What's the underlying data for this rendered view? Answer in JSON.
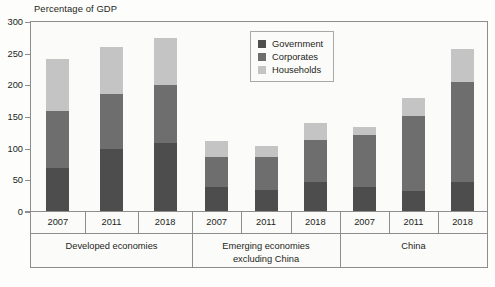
{
  "chart": {
    "title": "Percentage of GDP",
    "axis": {
      "y_ticks": [
        "0",
        "50",
        "100",
        "150",
        "200",
        "250",
        "300"
      ],
      "ylim_min": 0,
      "ylim_max": 300
    },
    "legend": {
      "items": [
        {
          "label": "Government",
          "color": "#4d4d4d"
        },
        {
          "label": "Corporates",
          "color": "#6e6e6e"
        },
        {
          "label": "Households",
          "color": "#c4c4c4"
        }
      ]
    },
    "groups": [
      {
        "name": "Developed economies",
        "line1": "Developed economies",
        "line2": ""
      },
      {
        "name": "Emerging economies excluding China",
        "line1": "Emerging economies",
        "line2": "excluding China"
      },
      {
        "name": "China",
        "line1": "China",
        "line2": ""
      }
    ],
    "years": [
      "2007",
      "2011",
      "2018",
      "2007",
      "2011",
      "2018",
      "2007",
      "2011",
      "2018"
    ]
  },
  "chart_data": {
    "type": "bar",
    "stacked": true,
    "title": "Percentage of GDP",
    "xlabel": "",
    "ylabel": "Percentage of GDP",
    "ylim": [
      0,
      300
    ],
    "ytick_step": 50,
    "grid": false,
    "legend_position": "top-center-inside",
    "group_labels": [
      "Developed economies",
      "Emerging economies excluding China",
      "China"
    ],
    "categories": [
      "Developed economies 2007",
      "Developed economies 2011",
      "Developed economies 2018",
      "Emerging economies excluding China 2007",
      "Emerging economies excluding China 2011",
      "Emerging economies excluding China 2018",
      "China 2007",
      "China 2011",
      "China 2018"
    ],
    "series": [
      {
        "name": "Government",
        "color": "#4d4d4d",
        "values": [
          70,
          100,
          109,
          40,
          35,
          47,
          40,
          33,
          47
        ]
      },
      {
        "name": "Corporates",
        "color": "#6e6e6e",
        "values": [
          90,
          86,
          91,
          47,
          52,
          66,
          82,
          119,
          159
        ]
      },
      {
        "name": "Households",
        "color": "#c4c4c4",
        "values": [
          82,
          75,
          75,
          25,
          17,
          27,
          13,
          28,
          52
        ]
      }
    ],
    "totals": [
      242,
      261,
      275,
      112,
      104,
      140,
      135,
      180,
      258
    ]
  }
}
